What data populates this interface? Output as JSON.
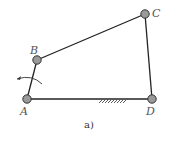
{
  "figure": {
    "caption": "a)",
    "colors": {
      "link": "#222222",
      "joint_fill": "#9a9a9a",
      "joint_stroke": "#333333",
      "label": "#555555"
    }
  },
  "joints": [
    {
      "id": "A",
      "label": "A",
      "x": 27,
      "y": 99
    },
    {
      "id": "B",
      "label": "B",
      "x": 37,
      "y": 60
    },
    {
      "id": "C",
      "label": "C",
      "x": 145,
      "y": 14
    },
    {
      "id": "D",
      "label": "D",
      "x": 152,
      "y": 99
    }
  ],
  "links": [
    {
      "from": "A",
      "to": "B",
      "name": "crank"
    },
    {
      "from": "B",
      "to": "C",
      "name": "coupler"
    },
    {
      "from": "C",
      "to": "D",
      "name": "rocker"
    },
    {
      "from": "A",
      "to": "D",
      "name": "ground"
    }
  ],
  "ground_hatch": {
    "x_start": 98,
    "x_end": 125,
    "y": 99
  },
  "rotation_arrow": {
    "direction": "counterclockwise",
    "center": "A"
  }
}
